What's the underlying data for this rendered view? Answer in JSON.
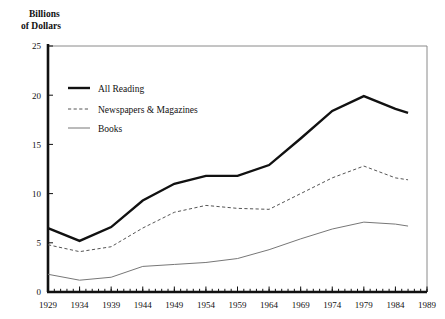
{
  "chart_data": {
    "type": "line",
    "title": "",
    "ylabel": "Billions of Dollars",
    "ylabel_line1": "Billions",
    "ylabel_line2": "of Dollars",
    "xlabel": "",
    "ylim": [
      0,
      25
    ],
    "xlim": [
      1929,
      1989
    ],
    "y_ticks": [
      0,
      5,
      10,
      15,
      20,
      25
    ],
    "y_tick_labels": [
      "0",
      "5",
      "10",
      "15",
      "20",
      "25"
    ],
    "x_ticks": [
      1929,
      1934,
      1939,
      1944,
      1949,
      1954,
      1959,
      1964,
      1969,
      1974,
      1979,
      1984,
      1989
    ],
    "x_tick_labels": [
      "1929",
      "1934",
      "1939",
      "1944",
      "1949",
      "1954",
      "1959",
      "1964",
      "1969",
      "1974",
      "1979",
      "1984",
      "1989"
    ],
    "x_minor_tick_step": 1,
    "grid": false,
    "legend_position": "upper-left-inside",
    "x": [
      1929,
      1934,
      1939,
      1944,
      1949,
      1954,
      1959,
      1964,
      1969,
      1974,
      1979,
      1984,
      1986
    ],
    "series": [
      {
        "name": "All Reading",
        "style": "solid",
        "width": 2.4,
        "color": "#111111",
        "values": [
          6.5,
          5.2,
          6.6,
          9.3,
          11.0,
          11.8,
          11.8,
          12.9,
          15.6,
          18.4,
          19.9,
          18.6,
          18.2
        ]
      },
      {
        "name": "Newspapers & Magazines",
        "style": "dashed",
        "width": 1.0,
        "color": "#555555",
        "values": [
          4.8,
          4.1,
          4.6,
          6.5,
          8.1,
          8.8,
          8.5,
          8.4,
          10.0,
          11.6,
          12.8,
          11.6,
          11.4
        ]
      },
      {
        "name": "Books",
        "style": "solid",
        "width": 1.0,
        "color": "#777777",
        "values": [
          1.8,
          1.2,
          1.5,
          2.6,
          2.8,
          3.0,
          3.4,
          4.3,
          5.4,
          6.4,
          7.1,
          6.9,
          6.7
        ]
      }
    ]
  },
  "legend": {
    "entries": [
      {
        "label": "All Reading"
      },
      {
        "label": "Newspapers & Magazines"
      },
      {
        "label": "Books"
      }
    ]
  }
}
